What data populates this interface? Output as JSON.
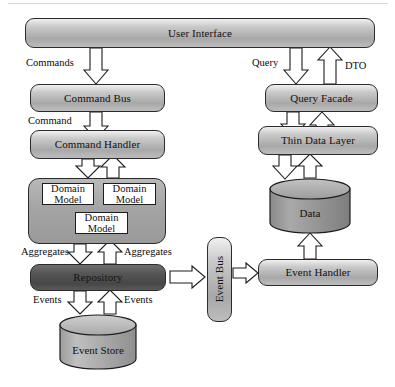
{
  "diagram": {
    "colors": {
      "node_fill_light": "#bdbdbd",
      "node_fill_dark": "#4f4f4f",
      "group_fill": "#a4a4a4",
      "cylinder_fill_light": "#b0b0b0",
      "cylinder_fill_dark": "#8d8d8d",
      "outline": "#2b2b2b",
      "arrow_fill": "#ffffff",
      "arrow_stroke": "#1d1d1d",
      "text": "#111111"
    },
    "nodes": {
      "user_interface": "User Interface",
      "command_bus": "Command Bus",
      "command_handler": "Command Handler",
      "domain_model_1": "Domain Model",
      "domain_model_2": "Domain Model",
      "domain_model_3": "Domain Model",
      "repository": "Repository",
      "event_store": "Event Store",
      "event_bus": "Event Bus",
      "event_handler": "Event Handler",
      "query_facade": "Query Facade",
      "thin_data_layer": "Thin Data Layer",
      "data": "Data"
    },
    "edge_labels": {
      "commands": "Commands",
      "command": "Command",
      "aggregates_left": "Aggregates",
      "aggregates_right": "Aggregates",
      "events_left": "Events",
      "events_right": "Events",
      "query": "Query",
      "dto": "DTO"
    },
    "caption": ""
  }
}
